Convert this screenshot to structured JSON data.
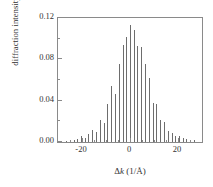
{
  "chart_data": {
    "type": "bar",
    "title": "",
    "subtitle": "",
    "xlabel": "Δk (1/Å)",
    "xlabel_parts": {
      "delta": "Δ",
      "k": "k",
      "units": "(1/Å)"
    },
    "ylabel": "diffraction intensity",
    "xlim": [
      -30,
      30
    ],
    "ylim": [
      0.0,
      0.12
    ],
    "xticks": [
      -20,
      0,
      20
    ],
    "xticklabels": [
      "-20",
      "0",
      "20"
    ],
    "xminorticks": [
      -25,
      -15,
      -10,
      -5,
      5,
      10,
      15,
      25
    ],
    "yticks": [
      0.0,
      0.04,
      0.08,
      0.12
    ],
    "yticklabels": [
      "0.00",
      "0.04",
      "0.08",
      "0.12"
    ],
    "yminorticks": [
      0.02,
      0.06,
      0.1
    ],
    "grid": false,
    "legend": false,
    "series_color": "#6d6d6d",
    "frame_color": "#8a8a8a",
    "categories": [
      -26.7,
      -25.1,
      -23.5,
      -22.0,
      -20.4,
      -18.8,
      -17.3,
      -15.7,
      -14.1,
      -12.6,
      -11.0,
      -9.4,
      -7.9,
      -6.3,
      -4.7,
      -3.1,
      -1.6,
      0.0,
      1.6,
      3.1,
      4.7,
      6.3,
      7.9,
      9.4,
      11.0,
      12.6,
      14.1,
      15.7,
      17.3,
      18.8,
      20.4,
      22.0,
      23.5,
      25.1,
      26.7,
      29.8
    ],
    "values": [
      0.0012,
      0.0018,
      0.0022,
      0.003,
      0.0055,
      0.004,
      0.0075,
      0.012,
      0.0095,
      0.0215,
      0.0185,
      0.037,
      0.054,
      0.0465,
      0.0755,
      0.0935,
      0.1015,
      0.113,
      0.108,
      0.093,
      0.092,
      0.0755,
      0.062,
      0.0375,
      0.037,
      0.0215,
      0.019,
      0.011,
      0.0085,
      0.0055,
      0.006,
      0.0035,
      0.0028,
      0.0022,
      0.0016,
      0.1265
    ]
  }
}
